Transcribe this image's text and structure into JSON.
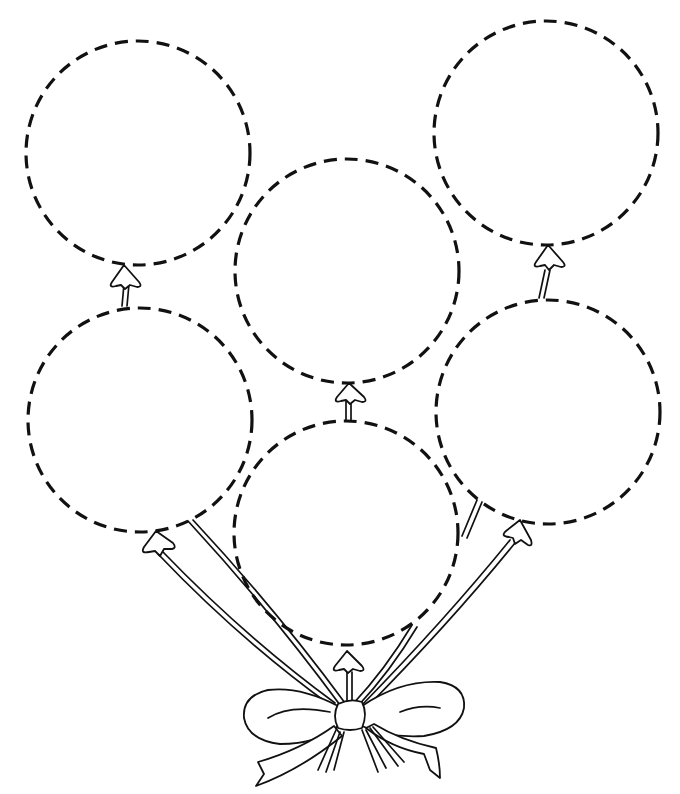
{
  "page": {
    "title": "",
    "kind": "coloring-sheet",
    "colors": {
      "ink": "#111111",
      "paper": "#ffffff"
    }
  },
  "balloons": [
    {
      "id": "top-left",
      "style": "dashed-outline"
    },
    {
      "id": "top-right",
      "style": "dashed-outline"
    },
    {
      "id": "middle-center",
      "style": "dashed-outline"
    },
    {
      "id": "middle-left",
      "style": "dashed-outline"
    },
    {
      "id": "middle-right",
      "style": "dashed-outline"
    },
    {
      "id": "bottom-center",
      "style": "dashed-outline"
    }
  ],
  "bow": {
    "style": "ribbon-bow",
    "count": 1
  }
}
